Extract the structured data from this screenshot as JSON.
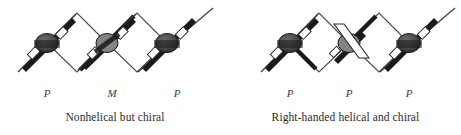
{
  "figure": {
    "width": 461,
    "height": 135,
    "background_color": "#ffffff"
  },
  "style": {
    "node_fill": "#7a7a7a",
    "node_stroke": "#1a1a1a",
    "bold_bond_color": "#1a1a1a",
    "thin_bond_color": "#4a4a4a",
    "white_bond_fill": "#ffffff",
    "text_color": "#2b2b2b"
  },
  "panels": [
    {
      "id": "left",
      "caption": "Nonhelical but chiral",
      "descriptors": [
        {
          "label": "P",
          "x": 47
        },
        {
          "label": "M",
          "x": 112
        },
        {
          "label": "P",
          "x": 177
        }
      ],
      "nodes": [
        {
          "id": "node-1",
          "x": 47,
          "y": 43,
          "shading": "dark",
          "rod": "black",
          "rod_direction": "down-right"
        },
        {
          "id": "node-2",
          "x": 107,
          "y": 43,
          "shading": "hatched",
          "rod": "black",
          "rod_direction": "up-right"
        },
        {
          "id": "node-3",
          "x": 167,
          "y": 43,
          "shading": "dark",
          "rod": "black",
          "rod_direction": "down-right"
        }
      ],
      "apexes": [
        {
          "id": "apex-top-1",
          "x": 77,
          "y": 13
        },
        {
          "id": "apex-bottom-1",
          "x": 77,
          "y": 72
        },
        {
          "id": "apex-top-2",
          "x": 137,
          "y": 13
        },
        {
          "id": "apex-bottom-2",
          "x": 137,
          "y": 72
        }
      ]
    },
    {
      "id": "right",
      "caption": "Right-handed helical and chiral",
      "descriptors": [
        {
          "label": "P",
          "x": 60
        },
        {
          "label": "P",
          "x": 119
        },
        {
          "label": "P",
          "x": 179
        }
      ],
      "nodes": [
        {
          "id": "node-1",
          "x": 60,
          "y": 43,
          "shading": "dark",
          "rod": "black",
          "rod_direction": "down-right"
        },
        {
          "id": "node-2",
          "x": 119,
          "y": 43,
          "shading": "hatched",
          "rod": "white",
          "rod_direction": "down-left"
        },
        {
          "id": "node-3",
          "x": 179,
          "y": 43,
          "shading": "dark",
          "rod": "black",
          "rod_direction": "down-right"
        }
      ],
      "apexes": [
        {
          "id": "apex-top-1",
          "x": 89,
          "y": 13
        },
        {
          "id": "apex-bottom-1",
          "x": 89,
          "y": 72
        },
        {
          "id": "apex-top-2",
          "x": 149,
          "y": 13
        },
        {
          "id": "apex-bottom-2",
          "x": 149,
          "y": 72
        }
      ]
    }
  ]
}
